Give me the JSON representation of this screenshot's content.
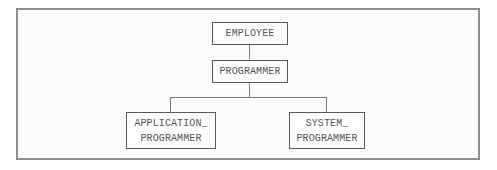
{
  "diagram": {
    "type": "hierarchy",
    "nodes": {
      "employee": {
        "lines": [
          "EMPLOYEE"
        ]
      },
      "programmer": {
        "lines": [
          "PROGRAMMER"
        ]
      },
      "application_programmer": {
        "lines": [
          "APPLICATION_",
          "PROGRAMMER"
        ]
      },
      "system_programmer": {
        "lines": [
          "SYSTEM_",
          "PROGRAMMER"
        ]
      }
    },
    "edges": [
      {
        "from": "EMPLOYEE",
        "to": "PROGRAMMER"
      },
      {
        "from": "PROGRAMMER",
        "to": "APPLICATION_PROGRAMMER"
      },
      {
        "from": "PROGRAMMER",
        "to": "SYSTEM_PROGRAMMER"
      }
    ],
    "colors": {
      "frame_border": "#8e8e8e",
      "box_border": "#5a5a5a",
      "text": "#555555",
      "connector": "#7a7a7a"
    }
  }
}
